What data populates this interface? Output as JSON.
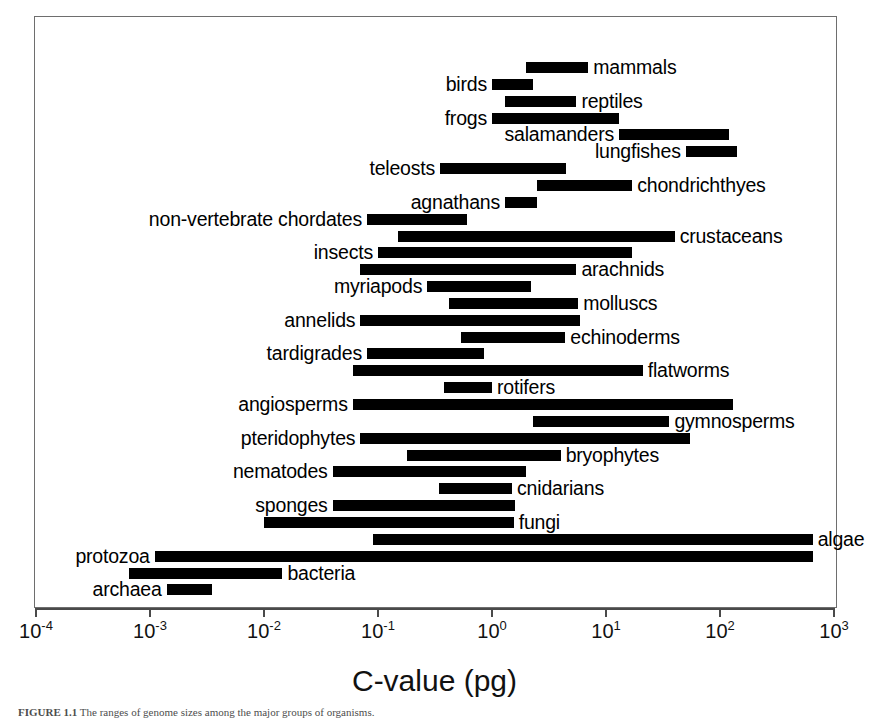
{
  "figure": {
    "x_axis_title": "C-value (pg)",
    "caption_prefix": "FIGURE 1.1",
    "caption_text": "  The ranges of genome sizes among the major groups of organisms."
  },
  "chart_data": {
    "type": "bar",
    "orientation": "horizontal-range",
    "title": "",
    "xlabel": "C-value (pg)",
    "ylabel": "",
    "xscale": "log",
    "xlim": [
      0.0001,
      1000
    ],
    "grid": false,
    "legend": false,
    "tick_labels": [
      "10⁻⁴",
      "10⁻³",
      "10⁻²",
      "10⁻¹",
      "10⁰",
      "10¹",
      "10²",
      "10³"
    ],
    "tick_values": [
      0.0001,
      0.001,
      0.01,
      0.1,
      1,
      10,
      100,
      1000
    ],
    "tick_mantissas": [
      "10",
      "10",
      "10",
      "10",
      "10",
      "10",
      "10",
      "10"
    ],
    "tick_exponents": [
      "-4",
      "-3",
      "-2",
      "-1",
      "0",
      "1",
      "2",
      "3"
    ],
    "bars": [
      {
        "label": "mammals",
        "min": 2.0,
        "max": 7.0,
        "label_side": "right"
      },
      {
        "label": "birds",
        "min": 1.0,
        "max": 2.3,
        "label_side": "left"
      },
      {
        "label": "reptiles",
        "min": 1.3,
        "max": 5.5,
        "label_side": "right"
      },
      {
        "label": "frogs",
        "min": 1.0,
        "max": 13.0,
        "label_side": "left"
      },
      {
        "label": "salamanders",
        "min": 13.0,
        "max": 120.0,
        "label_side": "left"
      },
      {
        "label": "lungfishes",
        "min": 50.0,
        "max": 140.0,
        "label_side": "left"
      },
      {
        "label": "teleosts",
        "min": 0.35,
        "max": 4.5,
        "label_side": "left"
      },
      {
        "label": "chondrichthyes",
        "min": 2.5,
        "max": 17.0,
        "label_side": "right"
      },
      {
        "label": "agnathans",
        "min": 1.3,
        "max": 2.5,
        "label_side": "left"
      },
      {
        "label": "non-vertebrate chordates",
        "min": 0.08,
        "max": 0.6,
        "label_side": "left"
      },
      {
        "label": "crustaceans",
        "min": 0.15,
        "max": 40.0,
        "label_side": "right"
      },
      {
        "label": "insects",
        "min": 0.1,
        "max": 17.0,
        "label_side": "left"
      },
      {
        "label": "arachnids",
        "min": 0.07,
        "max": 5.5,
        "label_side": "right"
      },
      {
        "label": "myriapods",
        "min": 0.27,
        "max": 2.2,
        "label_side": "left"
      },
      {
        "label": "molluscs",
        "min": 0.42,
        "max": 5.7,
        "label_side": "right"
      },
      {
        "label": "annelids",
        "min": 0.07,
        "max": 5.9,
        "label_side": "left"
      },
      {
        "label": "echinoderms",
        "min": 0.53,
        "max": 4.4,
        "label_side": "right"
      },
      {
        "label": "tardigrades",
        "min": 0.08,
        "max": 0.85,
        "label_side": "left"
      },
      {
        "label": "flatworms",
        "min": 0.06,
        "max": 21.0,
        "label_side": "right"
      },
      {
        "label": "rotifers",
        "min": 0.38,
        "max": 1.0,
        "label_side": "right"
      },
      {
        "label": "angiosperms",
        "min": 0.06,
        "max": 130.0,
        "label_side": "left"
      },
      {
        "label": "gymnosperms",
        "min": 2.3,
        "max": 36.0,
        "label_side": "right"
      },
      {
        "label": "pteridophytes",
        "min": 0.07,
        "max": 55.0,
        "label_side": "left"
      },
      {
        "label": "bryophytes",
        "min": 0.18,
        "max": 4.0,
        "label_side": "right"
      },
      {
        "label": "nematodes",
        "min": 0.04,
        "max": 2.0,
        "label_side": "left"
      },
      {
        "label": "cnidarians",
        "min": 0.34,
        "max": 1.5,
        "label_side": "right"
      },
      {
        "label": "sponges",
        "min": 0.04,
        "max": 1.6,
        "label_side": "left"
      },
      {
        "label": "fungi",
        "min": 0.01,
        "max": 1.55,
        "label_side": "right"
      },
      {
        "label": "algae",
        "min": 0.09,
        "max": 650.0,
        "label_side": "right"
      },
      {
        "label": "protozoa",
        "min": 0.0011,
        "max": 650.0,
        "label_side": "left"
      },
      {
        "label": "bacteria",
        "min": 0.00065,
        "max": 0.0145,
        "label_side": "right"
      },
      {
        "label": "archaea",
        "min": 0.0014,
        "max": 0.0035,
        "label_side": "left"
      }
    ]
  }
}
